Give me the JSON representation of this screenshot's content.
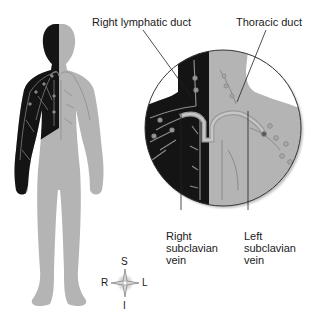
{
  "diagram": {
    "labels": {
      "right_lymphatic_duct": "Right lymphatic duct",
      "thoracic_duct": "Thoracic duct",
      "right_subclavian_vein": [
        "Right",
        "subclavian",
        "vein"
      ],
      "left_subclavian_vein": [
        "Left",
        "subclavian",
        "vein"
      ]
    },
    "compass": {
      "superior": "S",
      "inferior": "I",
      "right": "R",
      "left": "L"
    },
    "colors": {
      "drained_region": "#141414",
      "body": "#b4b4b4",
      "vessels": "#8c8c8c",
      "leader_lines": "#222222",
      "inset_outline": "#333333"
    }
  }
}
